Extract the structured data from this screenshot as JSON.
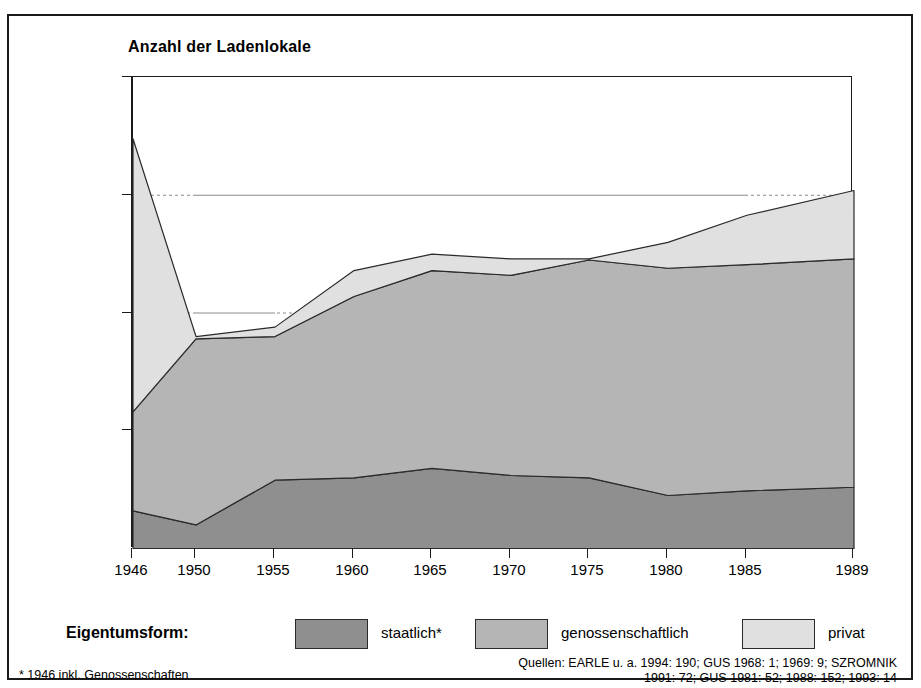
{
  "figure": {
    "plot_title": "Anzahl der Ladenlokale",
    "legend_title": "Eigentumsform:",
    "footnote": "* 1946 inkl. Genossenschaften",
    "sources_line1": "Quellen: EARLE u. a. 1994: 190; GUS 1968: 1; 1969: 9; SZROMNIK",
    "sources_line2": "1991: 72; GUS 1981: 52; 1988: 152; 1993: 14",
    "colors": {
      "staatlich": "#8f8f8f",
      "genossenschaftlich": "#b5b5b5",
      "privat": "#e0e0e0",
      "outline": "#2a2a2a",
      "frame": "#1a1a1a",
      "gridline": "#8a8a8a"
    }
  },
  "chart_data": {
    "type": "area",
    "title": "Anzahl der Ladenlokale",
    "xlabel": "",
    "ylabel": "Anzahl der Ladenlokale",
    "stacked": true,
    "grid": "dotted horizontal gridlines at 100 000 and 150 000",
    "legend_position": "below plot",
    "xlim": [
      1946,
      1989
    ],
    "ylim": [
      0,
      200000
    ],
    "yticks": [
      0,
      50000,
      100000,
      150000,
      200000
    ],
    "ytick_labels": [
      "",
      "50 000",
      "100 000",
      "150 000",
      "200 000"
    ],
    "x": [
      1946,
      1950,
      1955,
      1960,
      1965,
      1970,
      1975,
      1980,
      1985,
      1989
    ],
    "xtick_labels": [
      "1946",
      "1950",
      "1955",
      "1960",
      "1965",
      "1970",
      "1975",
      "1980",
      "1985",
      "1989"
    ],
    "series": [
      {
        "name": "staatlich*",
        "key": "staatlich",
        "color": "#8f8f8f",
        "values": [
          16000,
          10000,
          29000,
          30000,
          34000,
          31000,
          30000,
          22500,
          24500,
          26000
        ]
      },
      {
        "name": "genossenschaftlich",
        "key": "genossenschaftlich",
        "color": "#b5b5b5",
        "values": [
          42000,
          79000,
          61000,
          77000,
          84000,
          85000,
          92500,
          96500,
          96000,
          97000
        ]
      },
      {
        "name": "privat",
        "key": "privat",
        "color": "#e0e0e0",
        "values": [
          116000,
          1000,
          4000,
          11000,
          7000,
          7000,
          500,
          11000,
          21000,
          29000
        ]
      }
    ],
    "totals": [
      174000,
      90000,
      94000,
      118000,
      125000,
      123000,
      123000,
      130000,
      141500,
      152000
    ],
    "annotations": [
      "* 1946 inkl. Genossenschaften",
      "Quellen: EARLE u. a. 1994: 190; GUS 1968: 1; 1969: 9; SZROMNIK 1991: 72; GUS 1981: 52; 1988: 152; 1993: 14"
    ]
  }
}
